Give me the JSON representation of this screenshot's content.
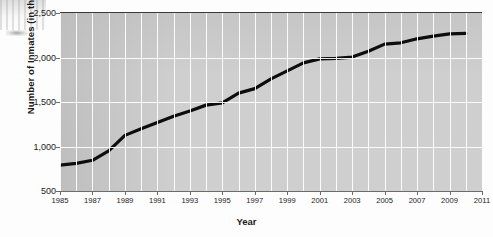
{
  "axes": {
    "y_title": "Number of Inmates (in thousands)",
    "x_title": "Year",
    "y_ticks": [
      "500",
      "1,000",
      "1,500",
      "2,000",
      "2,500"
    ],
    "x_ticks": [
      "1985",
      "1987",
      "1989",
      "1991",
      "1993",
      "1995",
      "1997",
      "1999",
      "2001",
      "2003",
      "2005",
      "2007",
      "2009",
      "2011"
    ]
  },
  "style": {
    "line_color": "#0d0d0d",
    "plot_background": "#cfcfcf",
    "grid_color": "#ffffff",
    "text_color": "#1b1b1b"
  },
  "chart_data": {
    "type": "line",
    "title": "",
    "xlabel": "Year",
    "ylabel": "Number of Inmates (in thousands)",
    "xlim": [
      1985,
      2011
    ],
    "ylim": [
      500,
      2500
    ],
    "ytick_values": [
      500,
      1000,
      1500,
      2000,
      2500
    ],
    "xtick_values": [
      1985,
      1987,
      1989,
      1991,
      1993,
      1995,
      1997,
      1999,
      2001,
      2003,
      2005,
      2007,
      2009,
      2011
    ],
    "grid": true,
    "legend": "none",
    "series": [
      {
        "name": "Number of Inmates",
        "x": [
          1985,
          1986,
          1987,
          1988,
          1989,
          1990,
          1991,
          1992,
          1993,
          1994,
          1995,
          1996,
          1997,
          1998,
          1999,
          2000,
          2001,
          2002,
          2003,
          2004,
          2005,
          2006,
          2007,
          2008,
          2009,
          2010
        ],
        "values": [
          790,
          810,
          845,
          950,
          1125,
          1200,
          1270,
          1340,
          1400,
          1465,
          1490,
          1600,
          1650,
          1760,
          1850,
          1940,
          1985,
          1990,
          2005,
          2070,
          2150,
          2165,
          2210,
          2240,
          2265,
          2270
        ]
      }
    ]
  }
}
